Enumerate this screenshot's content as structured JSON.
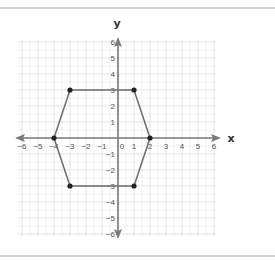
{
  "chart_data": {
    "type": "scatter",
    "title": "",
    "xlabel": "x",
    "ylabel": "y",
    "xlim": [
      -6,
      6
    ],
    "ylim": [
      -6,
      6
    ],
    "grid": true,
    "x_ticks": [
      "-6",
      "-5",
      "-4",
      "-3",
      "-2",
      "-1",
      "0",
      "1",
      "2",
      "3",
      "4",
      "5",
      "6"
    ],
    "y_ticks": [
      "6",
      "5",
      "4",
      "3",
      "2",
      "1",
      "-1",
      "-2",
      "-3",
      "-4",
      "-5",
      "-6"
    ],
    "shape": "hexagon",
    "series": [
      {
        "name": "hexagon",
        "closed": true,
        "points": [
          {
            "x": -4,
            "y": 0
          },
          {
            "x": -3,
            "y": 3
          },
          {
            "x": 1,
            "y": 3
          },
          {
            "x": 2,
            "y": 0
          },
          {
            "x": 1,
            "y": -3
          },
          {
            "x": -3,
            "y": -3
          }
        ]
      }
    ],
    "colors": {
      "axis": "#7a7a7a",
      "polygon": "#6b6b6b",
      "vertex": "#222222",
      "grid_major": "#e3e3e3",
      "grid_minor": "#f1f1f1"
    }
  }
}
